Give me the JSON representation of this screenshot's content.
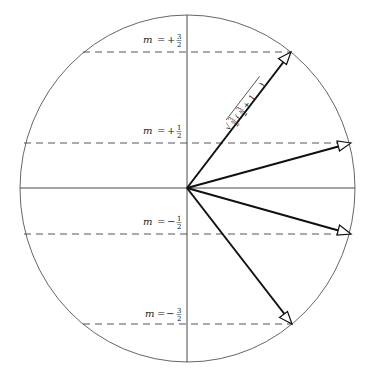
{
  "diagram": {
    "type": "vector-model-angular-momentum",
    "center": {
      "x": 187,
      "y": 188
    },
    "radius_x": 168,
    "radius_y": 174,
    "vector_label": {
      "prefix": "√",
      "s1_num": "3",
      "s1_den": "2",
      "open": "(",
      "s2_num": "3",
      "s2_den": "2",
      "plus_one": " + 1",
      "close": ")"
    },
    "levels": [
      {
        "name": "m-plus-three-halves",
        "m_var": "m",
        "eq": "=",
        "sign": "+",
        "num": "3",
        "den": "2",
        "y": 52,
        "tip_x": 291,
        "dash_x1": 83,
        "dash_x2": 291
      },
      {
        "name": "m-plus-one-half",
        "m_var": "m",
        "eq": "=",
        "sign": "+",
        "num": "1",
        "den": "2",
        "y": 143,
        "tip_x": 351,
        "dash_x1": 24,
        "dash_x2": 351
      },
      {
        "name": "m-minus-one-half",
        "m_var": "m",
        "eq": "=",
        "sign": "−",
        "num": "1",
        "den": "2",
        "y": 234,
        "tip_x": 351,
        "dash_x1": 24,
        "dash_x2": 351
      },
      {
        "name": "m-minus-three-halves",
        "m_var": "m",
        "eq": "=",
        "sign": "−",
        "num": "3",
        "den": "2",
        "y": 324,
        "tip_x": 292,
        "dash_x1": 83,
        "dash_x2": 292
      }
    ],
    "colors": {
      "line": "#111111",
      "circle": "#555555",
      "background": "#ffffff"
    }
  }
}
